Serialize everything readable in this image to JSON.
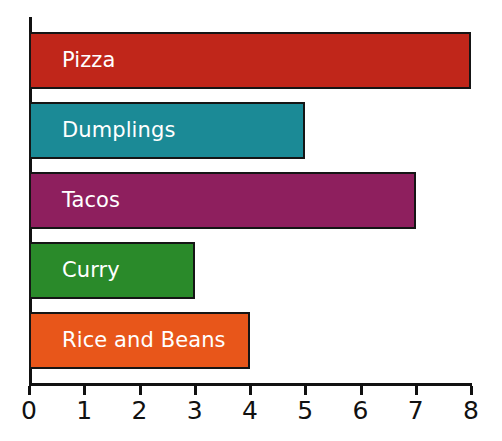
{
  "chart_data": {
    "type": "bar",
    "orientation": "horizontal",
    "title": "",
    "xlabel": "",
    "ylabel": "",
    "xlim": [
      0,
      8
    ],
    "xticks": [
      0,
      1,
      2,
      3,
      4,
      5,
      6,
      7,
      8
    ],
    "xtick_labels": [
      "0",
      "1",
      "2",
      "3",
      "4",
      "5",
      "6",
      "7",
      "8"
    ],
    "grid": false,
    "legend": false,
    "categories": [
      "Pizza",
      "Dumplings",
      "Tacos",
      "Curry",
      "Rice and Beans"
    ],
    "values": [
      8,
      5,
      7,
      3,
      4
    ],
    "bars": [
      {
        "label": "Pizza",
        "value": 8,
        "color": "#C0261A"
      },
      {
        "label": "Dumplings",
        "value": 5,
        "color": "#1B8A96"
      },
      {
        "label": "Tacos",
        "value": 7,
        "color": "#8E1F5E"
      },
      {
        "label": "Curry",
        "value": 3,
        "color": "#2A8A2A"
      },
      {
        "label": "Rice and Beans",
        "value": 4,
        "color": "#E8561A"
      }
    ],
    "label_color": "#FFFFFF",
    "bar_edge_color": "#151515",
    "axis_color": "#111111",
    "background_color": "#FFFFFF"
  }
}
